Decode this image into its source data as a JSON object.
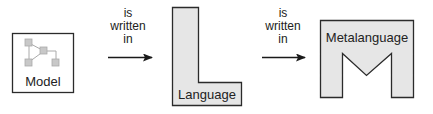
{
  "diagram": {
    "nodes": [
      {
        "id": "model",
        "label": "Model",
        "shape": "box-with-graph-icon"
      },
      {
        "id": "language",
        "label": "Language",
        "shape": "L-shape"
      },
      {
        "id": "metalanguage",
        "label": "Metalanguage",
        "shape": "M-shape"
      }
    ],
    "edges": [
      {
        "from": "model",
        "to": "language",
        "label_lines": [
          "is",
          "written",
          "in"
        ]
      },
      {
        "from": "language",
        "to": "metalanguage",
        "label_lines": [
          "is",
          "written",
          "in"
        ]
      }
    ],
    "colors": {
      "shape_fill": "#e6e6e6",
      "stroke": "#2b2b2b",
      "icon_fill": "#c8c8c8",
      "icon_stroke": "#aaaaaa",
      "text": "#222222"
    }
  }
}
